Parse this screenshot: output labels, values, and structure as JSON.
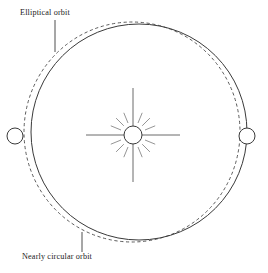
{
  "figure": {
    "type": "astronomy-orbit-diagram",
    "width": 268,
    "height": 273,
    "background_color": "#ffffff",
    "stroke_color": "#3a3a3a",
    "text_color": "#1a1a1a"
  },
  "labels": {
    "elliptical_orbit": "Elliptical orbit",
    "nearly_circular_orbit": "Nearly circular orbit"
  },
  "diagram_data": {
    "type": "diagram",
    "title": "",
    "elements": [
      {
        "name": "nearly-circular-orbit",
        "shape": "circle",
        "style": "solid",
        "center": [
          139,
          132
        ],
        "radius": 108,
        "label": "Nearly circular orbit"
      },
      {
        "name": "elliptical-orbit",
        "shape": "ellipse",
        "style": "dashed",
        "center": [
          132,
          132
        ],
        "radius_x": 108,
        "radius_y": 110,
        "label": "Elliptical orbit"
      },
      {
        "name": "sun",
        "shape": "circle-with-rays",
        "center": [
          133,
          135
        ],
        "radius": 9,
        "long_rays": 4,
        "short_rays": 12,
        "long_ray_length": 47,
        "short_ray_inner": 13,
        "short_ray_outer": 24
      },
      {
        "name": "planet-left",
        "shape": "circle",
        "center": [
          15,
          136
        ],
        "radius": 8,
        "on_orbit": "elliptical-orbit"
      },
      {
        "name": "planet-right",
        "shape": "circle",
        "center": [
          247,
          136
        ],
        "radius": 8,
        "on_orbit": "nearly-circular-orbit"
      },
      {
        "name": "leader-line-elliptical",
        "shape": "line",
        "from": [
          55,
          20
        ],
        "to": [
          55,
          52
        ]
      },
      {
        "name": "leader-line-nearly-circular",
        "shape": "line",
        "from": [
          82,
          232
        ],
        "to": [
          82,
          252
        ]
      }
    ]
  }
}
